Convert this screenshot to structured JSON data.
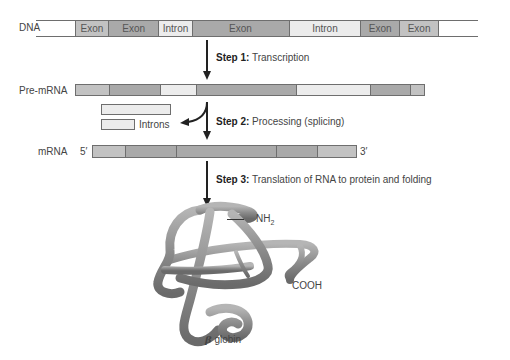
{
  "dna": {
    "label": "DNA",
    "segments": [
      {
        "type": "blank",
        "label": ""
      },
      {
        "type": "exon-light",
        "label": "Exon"
      },
      {
        "type": "exon-dark",
        "label": "Exon"
      },
      {
        "type": "intron",
        "label": "Intron"
      },
      {
        "type": "exon-dark",
        "label": "Exon"
      },
      {
        "type": "intron",
        "label": "Intron"
      },
      {
        "type": "exon-dark",
        "label": "Exon"
      },
      {
        "type": "exon-light",
        "label": "Exon"
      },
      {
        "type": "blank",
        "label": ""
      }
    ]
  },
  "steps": {
    "step1": {
      "prefix": "Step 1:",
      "text": " Transcription"
    },
    "step2": {
      "prefix": "Step 2:",
      "text": " Processing (splicing)"
    },
    "step3": {
      "prefix": "Step 3:",
      "text": " Translation of RNA to protein and folding"
    }
  },
  "pre_mrna": {
    "label": "Pre-mRNA"
  },
  "introns": {
    "label": "Introns"
  },
  "mrna": {
    "label": "mRNA",
    "five_prime": "5′",
    "three_prime": "3′"
  },
  "protein": {
    "nh2_label": "NH",
    "nh2_sub": "2",
    "cooh_label": "COOH",
    "beta_symbol": "β",
    "globin_label": " globin"
  },
  "colors": {
    "exon_light": "#c2c2c2",
    "exon_dark": "#a9a9a9",
    "intron": "#ececec",
    "protein": "#8c8c8c",
    "arrow": "#222222"
  }
}
